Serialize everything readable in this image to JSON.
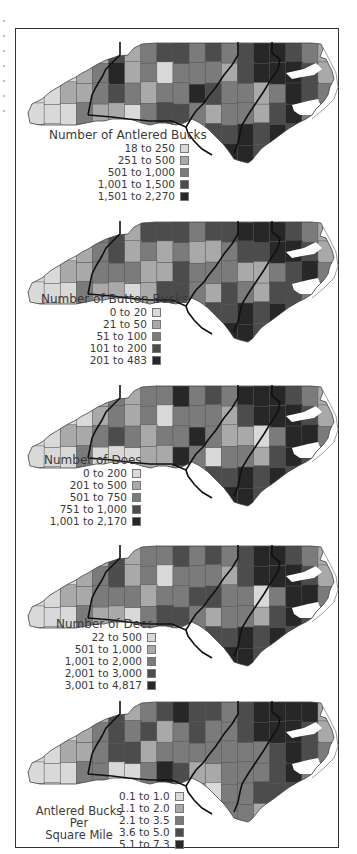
{
  "figure": {
    "palette": [
      "#d9d9d9",
      "#a9a9a9",
      "#7b7b7b",
      "#4c4c4c",
      "#272727"
    ],
    "region_line_color": "#111111",
    "county_line_color": "#555555"
  },
  "panels": [
    {
      "title": "Number of Antlered Bucks",
      "classes": [
        {
          "label": "18 to 250",
          "color": "#d9d9d9"
        },
        {
          "label": "251 to 500",
          "color": "#a9a9a9"
        },
        {
          "label": "501 to 1,000",
          "color": "#7b7b7b"
        },
        {
          "label": "1,001 to 1,500",
          "color": "#4c4c4c"
        },
        {
          "label": "1,501 to 2,270",
          "color": "#272727"
        }
      ]
    },
    {
      "title": "Number of Button Bucks",
      "classes": [
        {
          "label": "0 to 20",
          "color": "#d9d9d9"
        },
        {
          "label": "21 to 50",
          "color": "#a9a9a9"
        },
        {
          "label": "51 to 100",
          "color": "#7b7b7b"
        },
        {
          "label": "101 to 200",
          "color": "#4c4c4c"
        },
        {
          "label": "201 to 483",
          "color": "#272727"
        }
      ]
    },
    {
      "title": "Number of Does",
      "classes": [
        {
          "label": "0 to 200",
          "color": "#d9d9d9"
        },
        {
          "label": "201 to 500",
          "color": "#a9a9a9"
        },
        {
          "label": "501 to 750",
          "color": "#7b7b7b"
        },
        {
          "label": "751 to 1,000",
          "color": "#4c4c4c"
        },
        {
          "label": "1,001 to 2,170",
          "color": "#272727"
        }
      ]
    },
    {
      "title": "Number of Deer",
      "classes": [
        {
          "label": "22 to 500",
          "color": "#d9d9d9"
        },
        {
          "label": "501 to 1,000",
          "color": "#a9a9a9"
        },
        {
          "label": "1,001 to 2,000",
          "color": "#7b7b7b"
        },
        {
          "label": "2,001 to 3,000",
          "color": "#4c4c4c"
        },
        {
          "label": "3,001 to 4,817",
          "color": "#272727"
        }
      ]
    },
    {
      "title_lines": [
        "Antlered Bucks",
        "Per",
        "Square Mile"
      ],
      "classes": [
        {
          "label": "0.1 to 1.0",
          "color": "#d9d9d9"
        },
        {
          "label": "1.1 to 2.0",
          "color": "#a9a9a9"
        },
        {
          "label": "2.1 to 3.5",
          "color": "#7b7b7b"
        },
        {
          "label": "3.6 to 5.0",
          "color": "#4c4c4c"
        },
        {
          "label": "5.1 to 7.3",
          "color": "#272727"
        }
      ]
    }
  ]
}
